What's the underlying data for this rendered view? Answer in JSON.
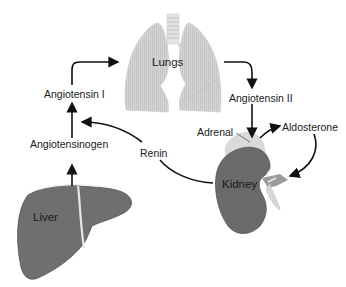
{
  "diagram": {
    "type": "flow",
    "nodes": {
      "lungs": "Lungs",
      "liver": "Liver",
      "kidney": "Kidney",
      "adrenal": "Adrenal",
      "angiotensinogen": "Angiotensinogen",
      "angiotensin_i": "Angiotensin I",
      "angiotensin_ii": "Angiotensin II",
      "renin": "Renin",
      "aldosterone": "Aldosterone"
    },
    "edges": [
      [
        "Liver",
        "Angiotensinogen"
      ],
      [
        "Angiotensinogen",
        "Angiotensin I"
      ],
      [
        "Angiotensin I",
        "Lungs"
      ],
      [
        "Lungs",
        "Angiotensin II"
      ],
      [
        "Angiotensin II",
        "Adrenal"
      ],
      [
        "Adrenal",
        "Aldosterone"
      ],
      [
        "Aldosterone",
        "Kidney"
      ],
      [
        "Kidney",
        "Renin"
      ],
      [
        "Renin",
        "Angiotensinogen"
      ]
    ],
    "colors": {
      "lung_fill": "#d4d4d4",
      "liver_fill": "#6e6e6e",
      "kidney_fill": "#6a6a6a",
      "adrenal_fill": "#dcdcdc",
      "arrow": "#111111"
    }
  }
}
